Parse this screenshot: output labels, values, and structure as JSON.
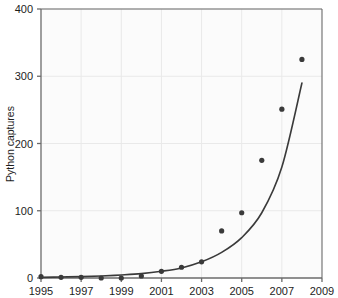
{
  "chart_data": {
    "type": "scatter",
    "title": "",
    "xlabel": "",
    "ylabel": "Python captures",
    "xlim": [
      1995,
      2009
    ],
    "ylim": [
      0,
      400
    ],
    "xticks": [
      1995,
      1997,
      1999,
      2001,
      2003,
      2005,
      2007,
      2009
    ],
    "xtick_labels": [
      "1995",
      "1997",
      "1999",
      "2001",
      "2003",
      "2005",
      "2007",
      "2009"
    ],
    "yticks": [
      0,
      100,
      200,
      300,
      400
    ],
    "ytick_labels": [
      "0",
      "100",
      "200",
      "300",
      "400"
    ],
    "grid": true,
    "legend": null,
    "x": [
      1995,
      1996,
      1997,
      1998,
      1999,
      2000,
      2001,
      2002,
      2003,
      2004,
      2005,
      2006,
      2007,
      2008
    ],
    "values": [
      2,
      1,
      1,
      0,
      0,
      3,
      10,
      16,
      24,
      70,
      97,
      175,
      251,
      325
    ],
    "series": [
      {
        "name": "Python captures",
        "type": "scatter",
        "marker": "circle",
        "color": "#3a3a3a",
        "x": [
          1995,
          1996,
          1997,
          1998,
          1999,
          2000,
          2001,
          2002,
          2003,
          2004,
          2005,
          2006,
          2007,
          2008
        ],
        "values": [
          2,
          1,
          1,
          0,
          0,
          3,
          10,
          16,
          24,
          70,
          97,
          175,
          251,
          325
        ]
      },
      {
        "name": "fitted exponential curve",
        "type": "line",
        "color": "#3a3a3a",
        "x": [
          1995,
          1996,
          1997,
          1998,
          1999,
          2000,
          2001,
          2002,
          2003,
          2004,
          2005,
          2006,
          2007,
          2008
        ],
        "values": [
          1,
          1.5,
          2,
          3,
          4.5,
          6.5,
          10,
          15,
          24,
          38,
          60,
          97,
          165,
          290
        ]
      }
    ],
    "annotations": []
  },
  "colors": {
    "axis": "#6b6b6b",
    "grid": "#e9e9e9",
    "marker": "#3a3a3a",
    "curve": "#3a3a3a",
    "plot_background": "#fbfbfb",
    "text": "#1d1d1d"
  }
}
